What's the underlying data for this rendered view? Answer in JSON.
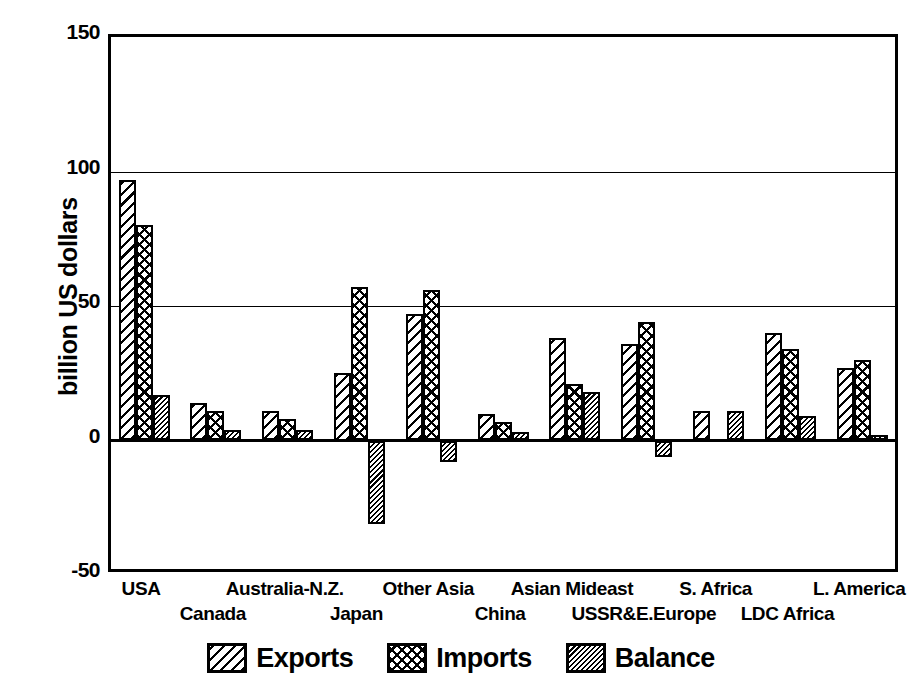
{
  "chart_data": {
    "type": "bar",
    "title": "",
    "xlabel": "",
    "ylabel": "billion US dollars",
    "ylim": [
      -50,
      150
    ],
    "yticks": [
      150,
      100,
      50,
      0,
      -50
    ],
    "ytick_labels": [
      "150",
      "100",
      "50",
      "0",
      "-50"
    ],
    "grid": true,
    "grid_axis": "y",
    "legend_position": "bottom",
    "categories": [
      "USA",
      "Canada",
      "Australia-N.Z.",
      "Japan",
      "Other Asia",
      "China",
      "Asian Mideast",
      "USSR&E.Europe",
      "S. Africa",
      "LDC Africa",
      "L. America"
    ],
    "series": [
      {
        "name": "Exports",
        "pattern": "diagonal-hatch",
        "values": [
          97,
          14,
          11,
          25,
          47,
          10,
          38,
          36,
          11,
          40,
          27
        ]
      },
      {
        "name": "Imports",
        "pattern": "cross-hatch",
        "values": [
          80,
          11,
          8,
          57,
          56,
          7,
          21,
          44,
          0,
          34,
          30
        ]
      },
      {
        "name": "Balance",
        "pattern": "dense-hatch",
        "values": [
          17,
          4,
          4,
          -31,
          -8,
          3,
          18,
          -6,
          11,
          9,
          2
        ]
      }
    ]
  },
  "axis": {
    "y_title": "billion US dollars",
    "y_tick_labels": [
      "150",
      "100",
      "50",
      "0",
      "-50"
    ]
  },
  "legend": {
    "items": [
      {
        "label": "Exports",
        "pattern": "diagonal-hatch"
      },
      {
        "label": "Imports",
        "pattern": "cross-hatch"
      },
      {
        "label": "Balance",
        "pattern": "dense-hatch"
      }
    ]
  },
  "colors": {
    "ink": "#000000",
    "paper": "#ffffff"
  }
}
